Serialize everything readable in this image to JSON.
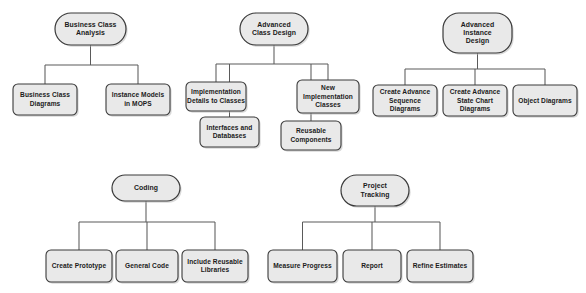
{
  "diagram": {
    "type": "hierarchy-tree-collection",
    "colors": {
      "node_fill": "#e9e9e9",
      "node_stroke": "#3a3a3a",
      "connector": "#5a5a5a",
      "text": "#1b1b1b",
      "background": "#ffffff",
      "shadow": "#b9b9b9"
    },
    "groups": [
      {
        "id": "business-class-analysis",
        "root": {
          "id": "root-business-class-analysis",
          "lines": [
            "Business Class",
            "Analysis"
          ],
          "x": 55,
          "y": 13,
          "w": 71,
          "h": 32,
          "shape": "rounded-stadium"
        },
        "children": [
          {
            "id": "business-class-diagrams",
            "lines": [
              "Business Class",
              "Diagrams"
            ],
            "x": 13,
            "y": 84,
            "w": 64,
            "h": 31,
            "shape": "rounded-rect"
          },
          {
            "id": "instance-models-in-mops",
            "lines": [
              "Instance Models",
              "in MOPS"
            ],
            "x": 106,
            "y": 84,
            "w": 64,
            "h": 31,
            "shape": "rounded-rect"
          }
        ],
        "bus_y": 65
      },
      {
        "id": "advanced-class-design",
        "root": {
          "id": "root-advanced-class-design",
          "lines": [
            "Advanced",
            "Class Design"
          ],
          "x": 240,
          "y": 13,
          "w": 68,
          "h": 32,
          "shape": "rounded-stadium"
        },
        "children": [
          {
            "id": "implementation-details-to-classes",
            "lines": [
              "Implementation",
              "Details to Classes"
            ],
            "x": 186,
            "y": 82,
            "w": 60,
            "h": 29,
            "shape": "rounded-rect"
          },
          {
            "id": "interfaces-and-databases",
            "lines": [
              "Interfaces and",
              "Databases"
            ],
            "x": 200,
            "y": 117,
            "w": 59,
            "h": 30,
            "shape": "rounded-rect"
          },
          {
            "id": "new-implementation-classes",
            "lines": [
              "New",
              "Implementation",
              "Classes"
            ],
            "x": 297,
            "y": 80,
            "w": 62,
            "h": 33,
            "shape": "rounded-rect"
          },
          {
            "id": "reusable-components",
            "lines": [
              "Reusable",
              "Components"
            ],
            "x": 281,
            "y": 121,
            "w": 60,
            "h": 29,
            "shape": "rounded-rect"
          }
        ],
        "bus_y": 64
      },
      {
        "id": "advanced-instance-design",
        "root": {
          "id": "root-advanced-instance-design",
          "lines": [
            "Advanced",
            "Instance",
            "Design"
          ],
          "x": 443,
          "y": 13,
          "w": 69,
          "h": 40,
          "shape": "rounded-stadium"
        },
        "children": [
          {
            "id": "create-advance-sequence-diagrams",
            "lines": [
              "Create Advance",
              "Sequence",
              "Diagrams"
            ],
            "x": 373,
            "y": 85,
            "w": 64,
            "h": 31,
            "shape": "rounded-rect"
          },
          {
            "id": "create-advance-state-chart-diagrams",
            "lines": [
              "Create Advance",
              "State Chart",
              "Diagrams"
            ],
            "x": 443,
            "y": 85,
            "w": 64,
            "h": 31,
            "shape": "rounded-rect"
          },
          {
            "id": "object-diagrams",
            "lines": [
              "Object Diagrams"
            ],
            "x": 513,
            "y": 85,
            "w": 64,
            "h": 31,
            "shape": "rounded-rect"
          }
        ],
        "bus_y": 69
      },
      {
        "id": "coding",
        "root": {
          "id": "root-coding",
          "lines": [
            "Coding"
          ],
          "x": 112,
          "y": 175,
          "w": 68,
          "h": 26,
          "shape": "rounded-stadium"
        },
        "children": [
          {
            "id": "create-prototype",
            "lines": [
              "Create Prototype"
            ],
            "x": 46,
            "y": 250,
            "w": 66,
            "h": 32,
            "shape": "rounded-rect"
          },
          {
            "id": "general-code",
            "lines": [
              "General Code"
            ],
            "x": 116,
            "y": 250,
            "w": 62,
            "h": 32,
            "shape": "rounded-rect"
          },
          {
            "id": "include-reusable-libraries",
            "lines": [
              "Include Reusable",
              "Libraries"
            ],
            "x": 182,
            "y": 250,
            "w": 66,
            "h": 32,
            "shape": "rounded-rect"
          }
        ],
        "bus_y": 222
      },
      {
        "id": "project-tracking",
        "root": {
          "id": "root-project-tracking",
          "lines": [
            "Project",
            "Tracking"
          ],
          "x": 341,
          "y": 175,
          "w": 68,
          "h": 31,
          "shape": "rounded-stadium"
        },
        "children": [
          {
            "id": "measure-progress",
            "lines": [
              "Measure Progress"
            ],
            "x": 268,
            "y": 250,
            "w": 69,
            "h": 32,
            "shape": "rounded-rect"
          },
          {
            "id": "report",
            "lines": [
              "Report"
            ],
            "x": 343,
            "y": 250,
            "w": 58,
            "h": 32,
            "shape": "rounded-rect"
          },
          {
            "id": "refine-estimates",
            "lines": [
              "Refine Estimates"
            ],
            "x": 407,
            "y": 250,
            "w": 66,
            "h": 32,
            "shape": "rounded-rect"
          }
        ],
        "bus_y": 222
      }
    ]
  }
}
